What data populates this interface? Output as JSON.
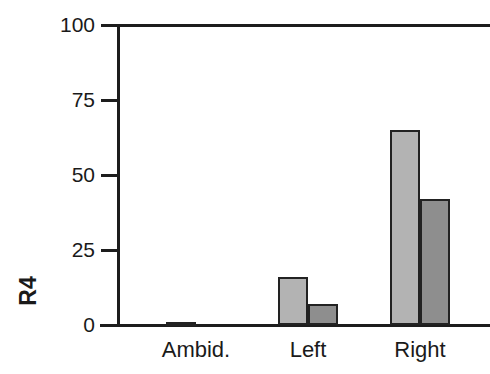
{
  "chart_data": {
    "type": "bar",
    "title": "",
    "subtitle": "",
    "xlabel": "",
    "ylabel": "R4",
    "categories": [
      "Ambid.",
      "Left",
      "Right"
    ],
    "series": [
      {
        "name": "series-1",
        "color": "#b3b3b3",
        "values": [
          1,
          16,
          65
        ]
      },
      {
        "name": "series-2",
        "color": "#8e8e8e",
        "values": [
          0,
          7,
          42
        ]
      }
    ],
    "ylim": [
      0,
      100
    ],
    "yticks": [
      0,
      25,
      50,
      75,
      100
    ],
    "ytick_labels": [
      "0",
      "25",
      "50",
      "75",
      "100"
    ],
    "grid": false,
    "legend": "none"
  },
  "axis": {
    "y_label": "R4",
    "y_ticks": [
      {
        "label": "100",
        "value": 100
      },
      {
        "label": "75",
        "value": 75
      },
      {
        "label": "50",
        "value": 50
      },
      {
        "label": "25",
        "value": 25
      },
      {
        "label": "0",
        "value": 0
      }
    ],
    "x_ticks": [
      {
        "label": "Ambid."
      },
      {
        "label": "Left"
      },
      {
        "label": "Right"
      }
    ]
  }
}
